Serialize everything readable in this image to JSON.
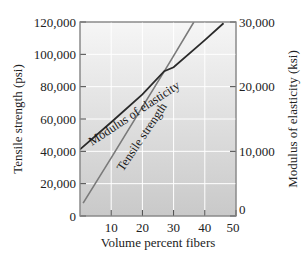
{
  "chart_data": {
    "type": "line",
    "title": "",
    "xlabel": "Volume percent fibers",
    "ylabel": "Tensile strength (psi)",
    "y2label": "Modulus of elasticity (ksi)",
    "xlim": [
      0,
      50
    ],
    "ylim": [
      0,
      120000
    ],
    "y2lim": [
      0,
      30000
    ],
    "x_ticks": [
      "10",
      "20",
      "30",
      "40",
      "50"
    ],
    "x_tick_values": [
      10,
      20,
      30,
      40,
      50
    ],
    "y_ticks": [
      "0",
      "20,000",
      "40,000",
      "60,000",
      "80,000",
      "100,000",
      "120,000"
    ],
    "y_tick_values": [
      0,
      20000,
      40000,
      60000,
      80000,
      100000,
      120000
    ],
    "y2_ticks": [
      "0",
      "10,000",
      "20,000",
      "30,000"
    ],
    "y2_tick_values": [
      0,
      10000,
      20000,
      30000
    ],
    "grid": true,
    "legend": "inline labels along lines",
    "series": [
      {
        "name": "Tensile strength",
        "axis": "left",
        "units": "psi",
        "color": "#7a7a7a",
        "x": [
          1,
          10,
          20,
          27,
          30,
          36.5
        ],
        "values": [
          8000,
          36000,
          67500,
          89500,
          99000,
          120000
        ]
      },
      {
        "name": "Modulus of elasticity",
        "axis": "right",
        "units": "ksi",
        "color": "#2a2a2a",
        "x": [
          0,
          10,
          20,
          27,
          30,
          40,
          46
        ],
        "values": [
          10300,
          14500,
          18800,
          22400,
          23000,
          27200,
          29800
        ]
      }
    ]
  },
  "labels": {
    "xlabel": "Volume percent fibers",
    "ylabel": "Tensile strength (psi)",
    "y2label": "Modulus of elasticity (ksi)",
    "tensile": "Tensile strength",
    "modulus": "Modulus of elasticity"
  },
  "colors": {
    "bg_top": "#f6f6f6",
    "bg_bottom": "#c9c9c9",
    "grid": "#ffffff",
    "tensile_line": "#7a7a7a",
    "modulus_line": "#2a2a2a",
    "axis": "#555555"
  }
}
